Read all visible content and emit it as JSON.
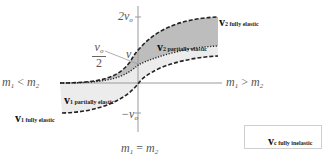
{
  "diagram": {
    "type": "velocity-vs-mass-ratio collision diagram",
    "axis_labels": {
      "top_tick": "2v",
      "top_tick_sub": "o",
      "bottom_tick": "−v",
      "bottom_tick_sub": "o",
      "half_tick_num": "v",
      "half_tick_num_sub": "o",
      "half_tick_den": "2",
      "center_point": "v",
      "left_region": {
        "m1": "m",
        "m1_sub": "1",
        "op": "<",
        "m2": "m",
        "m2_sub": "2"
      },
      "right_region": {
        "m1": "m",
        "m1_sub": "1",
        "op": ">",
        "m2": "m",
        "m2_sub": "2"
      },
      "bottom_region": {
        "m1": "m",
        "m1_sub": "1",
        "op": "=",
        "m2": "m",
        "m2_sub": "2"
      }
    },
    "curves": [
      {
        "id": "v2-fully-elastic",
        "label": "v",
        "sub": "2 fully elastic",
        "style": "dashed"
      },
      {
        "id": "vc-fully-inelastic",
        "label": "v",
        "sub": "c fully inelastic",
        "style": "dotted"
      },
      {
        "id": "v1-fully-elastic",
        "label": "v",
        "sub": "1 fully elastic",
        "style": "dashed"
      }
    ],
    "regions": [
      {
        "id": "v2-partially-elastic",
        "label": "v",
        "sub": "2 partially elastic",
        "fill": "#bdbdbd"
      },
      {
        "id": "v1-partially-elastic",
        "label": "v",
        "sub": "1 partially elastic",
        "fill": "#ececec"
      }
    ],
    "legend": {
      "label": "v",
      "sub": "c fully inelastic",
      "swatch": "dotted"
    },
    "colors": {
      "axis": "#9a9a9a",
      "curve": "#222222",
      "dark_fill": "#bdbdbd",
      "light_fill": "#ececec"
    }
  }
}
